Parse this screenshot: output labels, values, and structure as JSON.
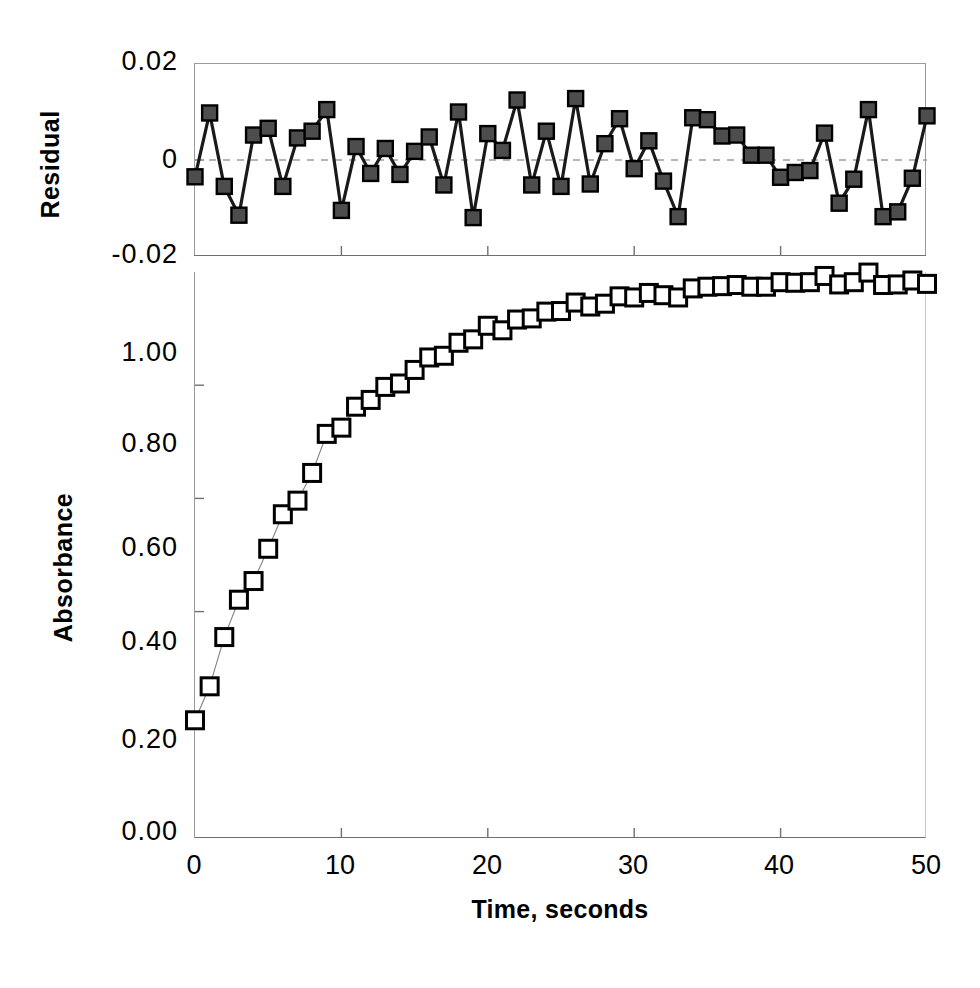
{
  "figure": {
    "xlabel": "Time, seconds",
    "residual_ylabel": "Residual",
    "absorbance_ylabel": "Absorbance"
  },
  "chart_data": [
    {
      "type": "scatter",
      "panel": "residual",
      "title": "",
      "xlabel": "",
      "ylabel": "Residual",
      "xlim": [
        0,
        50
      ],
      "ylim": [
        -0.02,
        0.02
      ],
      "xticks": [
        0,
        10,
        20,
        30,
        40,
        50
      ],
      "yticks": [
        -0.02,
        0,
        0.02
      ],
      "ytick_labels": [
        "-0.02",
        "0",
        "0.02"
      ],
      "grid": false,
      "legend": "none",
      "zero_line": 0,
      "marker": "filled-square",
      "marker_color": "#4d4d4d",
      "marker_edge_color": "#000000",
      "line_color": "#1a1a1a",
      "x": [
        0,
        1,
        2,
        3,
        4,
        5,
        6,
        7,
        8,
        9,
        10,
        11,
        12,
        13,
        14,
        15,
        16,
        17,
        18,
        19,
        20,
        21,
        22,
        23,
        24,
        25,
        26,
        27,
        28,
        29,
        30,
        31,
        32,
        33,
        34,
        35,
        36,
        37,
        38,
        39,
        40,
        41,
        42,
        43,
        44,
        45,
        46,
        47,
        48,
        49,
        50
      ],
      "values": [
        -0.0035,
        0.0098,
        -0.0055,
        -0.0115,
        0.0052,
        0.0066,
        -0.0055,
        0.0046,
        0.006,
        0.0105,
        -0.0105,
        0.0028,
        -0.0028,
        0.0024,
        -0.003,
        0.0018,
        0.0048,
        -0.0052,
        0.01,
        -0.012,
        0.0055,
        0.002,
        0.0125,
        -0.0052,
        0.006,
        -0.0055,
        0.0128,
        -0.005,
        0.0034,
        0.0086,
        -0.0018,
        0.004,
        -0.0044,
        -0.0118,
        0.0088,
        0.0084,
        0.005,
        0.0052,
        0.001,
        0.001,
        -0.0036,
        -0.0026,
        -0.0022,
        0.0056,
        -0.009,
        -0.004,
        0.0105,
        -0.0118,
        -0.0108,
        -0.0038,
        0.0092
      ]
    },
    {
      "type": "scatter",
      "panel": "absorbance",
      "title": "",
      "xlabel": "Time, seconds",
      "ylabel": "Absorbance",
      "xlim": [
        0,
        50
      ],
      "ylim": [
        0.0,
        1.0
      ],
      "xticks": [
        0,
        10,
        20,
        30,
        40,
        50
      ],
      "yticks": [
        0.0,
        0.2,
        0.4,
        0.6,
        0.8,
        1.0
      ],
      "ytick_labels": [
        "0.00",
        "0.20",
        "0.40",
        "0.60",
        "0.80",
        "1.00"
      ],
      "grid": false,
      "legend": "none",
      "marker": "open-square",
      "marker_color": "#ffffff",
      "marker_edge_color": "#000000",
      "line_color": "#808080",
      "x": [
        0,
        1,
        2,
        3,
        4,
        5,
        6,
        7,
        8,
        9,
        10,
        11,
        12,
        13,
        14,
        15,
        16,
        17,
        18,
        19,
        20,
        21,
        22,
        23,
        24,
        25,
        26,
        27,
        28,
        29,
        30,
        31,
        32,
        33,
        34,
        35,
        36,
        37,
        38,
        39,
        40,
        41,
        42,
        43,
        44,
        45,
        46,
        47,
        48,
        49,
        50
      ],
      "values": [
        0.208,
        0.268,
        0.355,
        0.421,
        0.454,
        0.511,
        0.572,
        0.596,
        0.645,
        0.714,
        0.725,
        0.762,
        0.774,
        0.797,
        0.803,
        0.827,
        0.849,
        0.852,
        0.875,
        0.881,
        0.905,
        0.897,
        0.916,
        0.918,
        0.93,
        0.931,
        0.946,
        0.939,
        0.944,
        0.957,
        0.955,
        0.963,
        0.959,
        0.955,
        0.971,
        0.974,
        0.975,
        0.977,
        0.974,
        0.974,
        0.982,
        0.981,
        0.982,
        0.993,
        0.978,
        0.982,
        0.999,
        0.977,
        0.978,
        0.985,
        0.979
      ]
    }
  ],
  "residual_ticks": [
    {
      "label": "0.02",
      "top": 48
    },
    {
      "label": "0",
      "top": 146
    },
    {
      "label": "-0.02",
      "top": 241
    }
  ],
  "absorbance_ticks": [
    {
      "label": "1.00",
      "top": 339
    },
    {
      "label": "0.80",
      "top": 430
    },
    {
      "label": "0.60",
      "top": 534
    },
    {
      "label": "0.40",
      "top": 628
    },
    {
      "label": "0.20",
      "top": 726
    },
    {
      "label": "0.00",
      "top": 818
    }
  ],
  "xaxis_ticks": [
    {
      "label": "0",
      "left": 194
    },
    {
      "label": "10",
      "left": 340
    },
    {
      "label": "20",
      "left": 487
    },
    {
      "label": "30",
      "left": 633
    },
    {
      "label": "40",
      "left": 779
    },
    {
      "label": "50",
      "left": 926
    }
  ]
}
